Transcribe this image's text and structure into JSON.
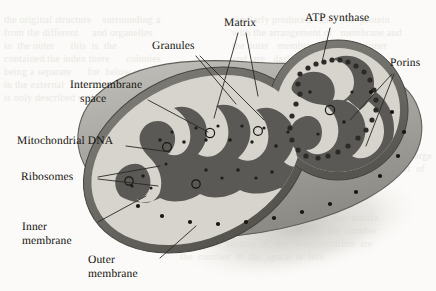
{
  "figure": {
    "background_color": "#fbfaf8",
    "ink_color": "#14120f",
    "colors": {
      "outer_membrane": "#6d6c68",
      "intermembrane_space": "#d4d2cb",
      "matrix": "#595854",
      "body_surface": "#a9a7a1",
      "shadow": "#d9d7d1",
      "porin_dot": "#1b1a17",
      "leader_line": "#2a2824"
    }
  },
  "labels": [
    {
      "id": "granules",
      "text": "Granules",
      "x": 152,
      "y": 40
    },
    {
      "id": "matrix",
      "text": "Matrix",
      "x": 224,
      "y": 17
    },
    {
      "id": "atp-synthase",
      "text": "ATP synthase",
      "x": 305,
      "y": 12
    },
    {
      "id": "porins",
      "text": "Porins",
      "x": 390,
      "y": 57
    },
    {
      "id": "intermembrane",
      "text": "Intermembrane",
      "x": 70,
      "y": 79
    },
    {
      "id": "intermembrane-2",
      "text": "space",
      "x": 80,
      "y": 93
    },
    {
      "id": "mitochondrial-dna",
      "text": "Mitochondrial DNA",
      "x": 17,
      "y": 135
    },
    {
      "id": "ribosomes",
      "text": "Ribosomes",
      "x": 21,
      "y": 171
    },
    {
      "id": "inner-membrane",
      "text": "Inner",
      "x": 22,
      "y": 221
    },
    {
      "id": "inner-membrane-2",
      "text": "membrane",
      "x": 22,
      "y": 235
    },
    {
      "id": "outer-membrane",
      "text": "Outer",
      "x": 88,
      "y": 254
    },
    {
      "id": "outer-membrane-2",
      "text": "membrane",
      "x": 88,
      "y": 268
    }
  ],
  "background_page_text": {
    "note": "faint illegible bleed-through text of the underlying book page",
    "lines": [
      "the original structure    surrounding a",
      "from the different     and organelles",
      "in  the outer      this  is  the",
      "contained the index there      colonies",
      "being a separate      for  below was",
      "in the external      in a  sample",
      "is only described within"
    ],
    "lines_right": [
      "similarly produced   and   the  protein",
      "with the arrangement of   membrane and",
      "the outer   membranes   of  the  inner",
      "and  are   dark     the    cristae in",
      "between them  lie  in  the  large",
      "enclosed   contains   a  net  of",
      "and  as  it  is",
      "within  and",
      "layer  deeply  has"
    ],
    "lines_bottom": [
      "these  folds  that  were  made  from  the  matrix",
      "that  in   addition   of   figure   for  the  number",
      "as such  a  section  in  the  mitochondrion  are",
      "the  number  in  the  space  is  less"
    ]
  }
}
